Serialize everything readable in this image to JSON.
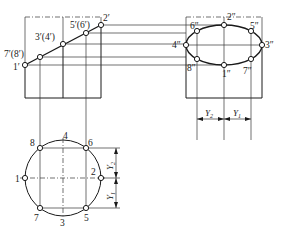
{
  "diagram": {
    "type": "orthographic projection of cylinder cut by inclined plane",
    "front_view": {
      "points": [
        {
          "id": "1",
          "label": "1′",
          "x": 25,
          "y": 65
        },
        {
          "id": "7_8",
          "label": "7′(8′)",
          "x": 40,
          "y": 57
        },
        {
          "id": "3_4",
          "label": "3′(4′)",
          "x": 63,
          "y": 44
        },
        {
          "id": "5_6",
          "label": "5′(6′)",
          "x": 86,
          "y": 33
        },
        {
          "id": "2",
          "label": "2′",
          "x": 101,
          "y": 25
        }
      ]
    },
    "side_view": {
      "points": [
        {
          "id": "6",
          "label": "6″"
        },
        {
          "id": "2",
          "label": "2″"
        },
        {
          "id": "5",
          "label": "5″"
        },
        {
          "id": "4",
          "label": "4″"
        },
        {
          "id": "3",
          "label": "3″"
        },
        {
          "id": "8",
          "label": "8″"
        },
        {
          "id": "1",
          "label": "1″"
        },
        {
          "id": "7",
          "label": "7″"
        }
      ],
      "dimensions": [
        {
          "label": "Y",
          "sub": "2"
        },
        {
          "label": "Y",
          "sub": "1"
        }
      ]
    },
    "top_view": {
      "points": [
        {
          "id": "8",
          "label": "8"
        },
        {
          "id": "4",
          "label": "4"
        },
        {
          "id": "6",
          "label": "6"
        },
        {
          "id": "1",
          "label": "1"
        },
        {
          "id": "2",
          "label": "2"
        },
        {
          "id": "7",
          "label": "7"
        },
        {
          "id": "3",
          "label": "3"
        },
        {
          "id": "5",
          "label": "5"
        }
      ],
      "dimensions": [
        {
          "label": "Y",
          "sub": "2"
        },
        {
          "label": "Y",
          "sub": "1"
        }
      ]
    }
  }
}
